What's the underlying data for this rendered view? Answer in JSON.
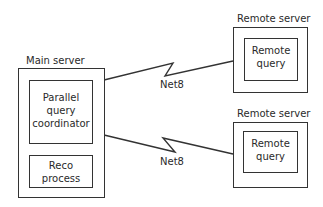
{
  "main_server": {
    "title": "Main server",
    "coordinator": {
      "line1": "Parallel",
      "line2": "query",
      "line3": "coordinator"
    },
    "reco": {
      "line1": "Reco",
      "line2": "process"
    }
  },
  "remote_servers": [
    {
      "title": "Remote server",
      "inner": {
        "line1": "Remote",
        "line2": "query"
      }
    },
    {
      "title": "Remote server",
      "inner": {
        "line1": "Remote",
        "line2": "query"
      }
    }
  ],
  "links": [
    {
      "label": "Net8"
    },
    {
      "label": "Net8"
    }
  ],
  "colors": {
    "stroke": "#333333",
    "text": "#2a2a2a",
    "background": "#ffffff"
  }
}
